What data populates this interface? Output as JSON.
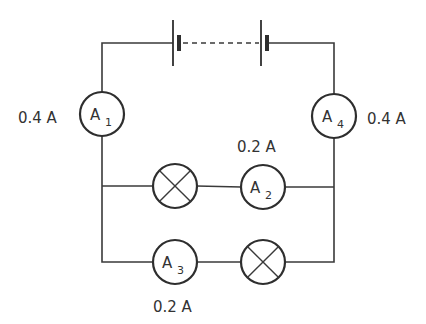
{
  "diagram": {
    "type": "circuit",
    "battery": {
      "cells_shown": 2,
      "connection": "dashed (more cells implied)"
    },
    "ammeters": [
      {
        "id": "A1",
        "letter": "A",
        "sub": "1",
        "reading": "0.4 A",
        "position": "left main wire"
      },
      {
        "id": "A2",
        "letter": "A",
        "sub": "2",
        "reading": "0.2 A",
        "position": "upper parallel branch"
      },
      {
        "id": "A3",
        "letter": "A",
        "sub": "3",
        "reading": "0.2 A",
        "position": "lower parallel branch"
      },
      {
        "id": "A4",
        "letter": "A",
        "sub": "4",
        "reading": "0.4 A",
        "position": "right main wire"
      }
    ],
    "lamps": [
      {
        "id": "lamp-1",
        "branch": "upper"
      },
      {
        "id": "lamp-2",
        "branch": "lower"
      }
    ]
  },
  "labels": {
    "a1_reading": "0.4 A",
    "a4_reading": "0.4 A",
    "a2_reading": "0.2 A",
    "a3_reading": "0.2 A"
  },
  "meters": {
    "a1": {
      "letter": "A",
      "sub": "1"
    },
    "a2": {
      "letter": "A",
      "sub": "2"
    },
    "a3": {
      "letter": "A",
      "sub": "3"
    },
    "a4": {
      "letter": "A",
      "sub": "4"
    }
  }
}
